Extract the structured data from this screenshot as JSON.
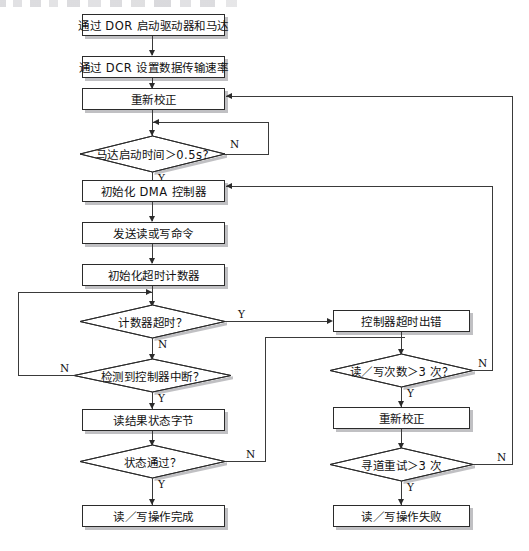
{
  "diagram": {
    "type": "flowchart",
    "title_partial_text_remnant": "",
    "nodes": {
      "start_motor": {
        "label": "通过 DOR 启动驱动器和马达",
        "shape": "process"
      },
      "set_rate": {
        "label": "通过 DCR 设置数据传输速率",
        "shape": "process"
      },
      "recalibrate_top": {
        "label": "重新校正",
        "shape": "process"
      },
      "motor_time": {
        "label": "马达启动时间＞0.5s?",
        "shape": "decision"
      },
      "init_dma": {
        "label": "初始化 DMA 控制器",
        "shape": "process"
      },
      "send_cmd": {
        "label": "发送读或写命令",
        "shape": "process"
      },
      "init_timer": {
        "label": "初始化超时计数器",
        "shape": "process"
      },
      "timer_expired": {
        "label": "计数器超时？",
        "shape": "decision"
      },
      "ctrl_irq": {
        "label": "检测到控制器中断？",
        "shape": "decision"
      },
      "read_status": {
        "label": "读结果状态字节",
        "shape": "process"
      },
      "status_ok": {
        "label": "状态通过？",
        "shape": "decision"
      },
      "op_done": {
        "label": "读／写操作完成",
        "shape": "process"
      },
      "ctrl_timeout_err": {
        "label": "控制器超时出错",
        "shape": "process"
      },
      "rw_count": {
        "label": "读／写次数＞3 次？",
        "shape": "decision"
      },
      "recalibrate_retry": {
        "label": "重新校正",
        "shape": "process"
      },
      "seek_retry": {
        "label": "寻道重试＞3 次",
        "shape": "decision"
      },
      "op_failed": {
        "label": "读／写操作失败",
        "shape": "process"
      }
    },
    "branch_labels": {
      "motor_time_no": "N",
      "motor_time_yes": "Y",
      "timer_expired_yes": "Y",
      "timer_expired_no": "N",
      "ctrl_irq_no": "N",
      "ctrl_irq_yes": "Y",
      "status_ok_no": "N",
      "status_ok_yes": "Y",
      "rw_count_no": "N",
      "rw_count_yes": "Y",
      "seek_retry_no": "N",
      "seek_retry_yes": "Y"
    },
    "colors": {
      "stroke": "#2b2b2b",
      "fill": "#ffffff",
      "shadow": "rgba(140,140,145,0.55)",
      "background": "#ffffff"
    }
  }
}
